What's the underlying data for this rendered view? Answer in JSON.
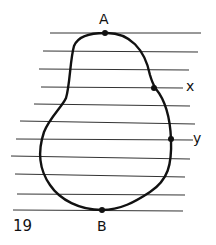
{
  "figure": {
    "number": "19",
    "points": {
      "top": "A",
      "bottom": "B"
    },
    "line_labels": {
      "upper": "x",
      "lower": "y"
    },
    "colors": {
      "stroke": "#111111",
      "lines": "#333333",
      "background": "#ffffff"
    }
  }
}
